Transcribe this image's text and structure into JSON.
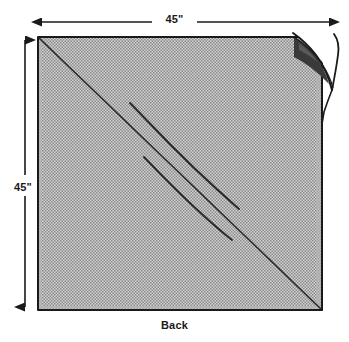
{
  "diagram": {
    "title": "Back",
    "caption": "Back",
    "dimensions": {
      "top_label": "45\"",
      "left_label": "45\"",
      "width_value": 45,
      "height_value": 45,
      "unit": "inches",
      "unit_symbol": "\""
    },
    "colors": {
      "panel_fill": "#c9c9c9",
      "panel_texture_dot": "#7d7d7d",
      "outline": "#1a1a1a",
      "fold_underside": "#3a3a3a",
      "fold_flap": "#ffffff",
      "background": "#ffffff",
      "text": "#1a1a1a"
    },
    "features": {
      "main_diagonal": "corner-to-corner fold line from top-left to bottom-right",
      "crease_upper": "curved crease line",
      "crease_lower": "curved crease line",
      "folded_corner": "top-right corner folded back revealing dark underside"
    }
  }
}
